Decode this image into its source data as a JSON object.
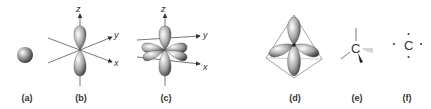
{
  "figure": {
    "panels": [
      {
        "id": "a",
        "label": "(a)",
        "content": "s orbital (sphere)"
      },
      {
        "id": "b",
        "label": "(b)",
        "content": "p orbital along z axis",
        "axes": [
          "z",
          "y",
          "x"
        ]
      },
      {
        "id": "c",
        "label": "(c)",
        "content": "three p orbitals (px, py, pz)",
        "axes": [
          "z",
          "y",
          "x"
        ]
      },
      {
        "id": "d",
        "label": "(d)",
        "content": "sp3 hybrid orbitals in tetrahedron"
      },
      {
        "id": "e",
        "label": "(e)",
        "content": "tetrahedral carbon wedge-dash",
        "atom": "C"
      },
      {
        "id": "f",
        "label": "(f)",
        "content": "Lewis dot carbon",
        "atom": "C"
      }
    ]
  }
}
